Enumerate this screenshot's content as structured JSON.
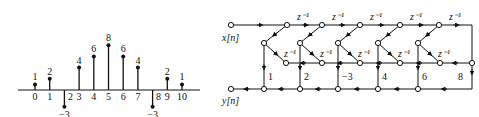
{
  "stem_plot": {
    "n": [
      0,
      1,
      2,
      3,
      4,
      5,
      6,
      7,
      8,
      9,
      10
    ],
    "h": [
      1,
      2,
      -3,
      4,
      6,
      8,
      6,
      4,
      -3,
      2,
      1
    ],
    "value_labels": [
      "1",
      "2",
      "−3",
      "4",
      "6",
      "8",
      "6",
      "4",
      "−3",
      "2",
      "1"
    ],
    "index_labels": [
      "0",
      "1",
      "2",
      "3",
      "4",
      "5",
      "6",
      "7",
      "8",
      "9",
      "10"
    ]
  },
  "flow_graph": {
    "input_label": "x[n]",
    "output_label": "y[n]",
    "delay_label": "z⁻¹",
    "coefficients": [
      "1",
      "2",
      "−3",
      "4",
      "6",
      "8"
    ]
  }
}
